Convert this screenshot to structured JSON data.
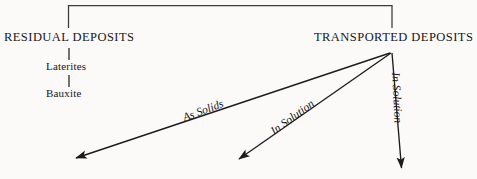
{
  "diagram": {
    "type": "flow-tree",
    "background_color": "#fbfaf8",
    "line_color": "#1c1c1e",
    "nodes": {
      "bracket_top": "",
      "residual_deposits": "RESIDUAL DEPOSITS",
      "laterites": "Laterites",
      "bauxite": "Bauxite",
      "transported_deposits": "TRANSPORTED DEPOSITS"
    },
    "edge_labels": {
      "as_solids": "As Solids",
      "in_solution_middle": "In Solution",
      "in_solution_right": "In Solution"
    },
    "clipped_caption": "",
    "geometry": {
      "bracket_left_x": 68,
      "bracket_right_x": 392,
      "bracket_top_y": 5,
      "fan_origin_x": 392,
      "fan_origin_y": 51,
      "arrow_tips": [
        {
          "x": 72,
          "y": 160
        },
        {
          "x": 235,
          "y": 162
        },
        {
          "x": 402,
          "y": 172
        }
      ]
    }
  }
}
